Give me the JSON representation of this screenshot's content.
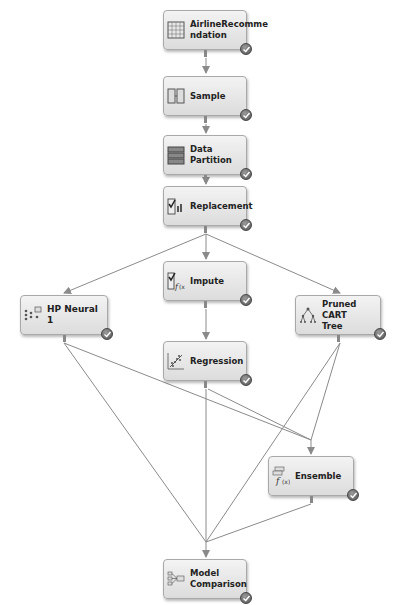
{
  "diagram": {
    "type": "process-flow",
    "colors": {
      "node_fill_top": "#f3f3f3",
      "node_fill_bottom": "#dcdcdc",
      "node_border": "#a9a9a9",
      "edge": "#8a8a8a",
      "status_check": "#555555"
    },
    "nodes": [
      {
        "id": "airline",
        "label": "AirlineRecomme ndation",
        "label_lines": [
          "AirlineRecomme",
          "ndation"
        ],
        "icon": "data-source-icon",
        "status": "completed"
      },
      {
        "id": "sample",
        "label": "Sample",
        "icon": "sample-icon",
        "status": "completed"
      },
      {
        "id": "partition",
        "label": "Data Partition",
        "icon": "data-partition-icon",
        "status": "completed"
      },
      {
        "id": "replacement",
        "label": "Replacement",
        "icon": "replacement-icon",
        "status": "completed"
      },
      {
        "id": "impute",
        "label": "Impute",
        "icon": "impute-icon",
        "status": "completed"
      },
      {
        "id": "hpneural",
        "label": "HP Neural 1",
        "icon": "neural-network-icon",
        "status": "completed"
      },
      {
        "id": "cart",
        "label": "Pruned CART Tree",
        "label_lines": [
          "Pruned CART",
          "Tree"
        ],
        "icon": "decision-tree-icon",
        "status": "completed"
      },
      {
        "id": "regression",
        "label": "Regression",
        "icon": "regression-icon",
        "status": "completed"
      },
      {
        "id": "ensemble",
        "label": "Ensemble",
        "icon": "ensemble-icon",
        "status": "completed"
      },
      {
        "id": "modelcomp",
        "label": "Model Comparison",
        "label_lines": [
          "Model",
          "Comparison"
        ],
        "icon": "model-comparison-icon",
        "status": "completed"
      }
    ],
    "edges": [
      {
        "from": "airline",
        "to": "sample"
      },
      {
        "from": "sample",
        "to": "partition"
      },
      {
        "from": "partition",
        "to": "replacement"
      },
      {
        "from": "replacement",
        "to": "hpneural"
      },
      {
        "from": "replacement",
        "to": "impute"
      },
      {
        "from": "replacement",
        "to": "cart"
      },
      {
        "from": "impute",
        "to": "regression"
      },
      {
        "from": "hpneural",
        "to": "ensemble"
      },
      {
        "from": "regression",
        "to": "ensemble"
      },
      {
        "from": "cart",
        "to": "ensemble"
      },
      {
        "from": "hpneural",
        "to": "modelcomp"
      },
      {
        "from": "regression",
        "to": "modelcomp"
      },
      {
        "from": "cart",
        "to": "modelcomp"
      },
      {
        "from": "ensemble",
        "to": "modelcomp"
      }
    ]
  }
}
